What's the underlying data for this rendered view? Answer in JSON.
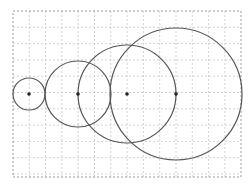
{
  "diagram": {
    "type": "circles-on-grid",
    "grid": {
      "x0": 13,
      "y0": 11,
      "x1": 241,
      "y1": 177,
      "spacing": 16.3,
      "line_color": "#c8c8c8",
      "border_color": "#9a9a9a"
    },
    "stroke_color": "#555555",
    "point_color": "#222222",
    "circles": [
      {
        "cx": 29,
        "cy": 94,
        "r": 16
      },
      {
        "cx": 78,
        "cy": 94,
        "r": 33
      },
      {
        "cx": 127,
        "cy": 94,
        "r": 49
      },
      {
        "cx": 176,
        "cy": 94,
        "r": 66
      }
    ]
  }
}
